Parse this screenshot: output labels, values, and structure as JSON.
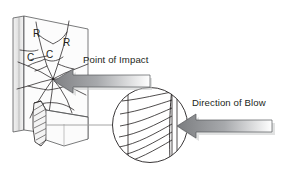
{
  "figure": {
    "title_text": "",
    "background_color": "#ffffff",
    "ink_color": "#231f20",
    "line_color": "#58595b",
    "arrow_fill_dark": "#808184",
    "arrow_fill_light": "#d1d3d4",
    "panel_fill": "#fbfbfb",
    "slab_fill": "#e8e8e8"
  },
  "labels": {
    "point_of_impact": "Point of Impact",
    "direction_of_blow": "Direction of Blow"
  },
  "crack_markers": [
    {
      "id": "radial-1",
      "text": "R",
      "x": 35,
      "y": 36
    },
    {
      "id": "radial-2",
      "text": "R",
      "x": 65,
      "y": 45
    },
    {
      "id": "concentric-1",
      "text": "C",
      "x": 30,
      "y": 60
    },
    {
      "id": "concentric-2",
      "text": "C",
      "x": 49,
      "y": 57
    }
  ],
  "legend_meaning": {
    "R": "Radial crack",
    "C": "Concentric crack"
  },
  "callout": {
    "name": "magnified-edge-view",
    "center_x": 150,
    "center_y": 125,
    "radius": 38,
    "description": "conchoidal-rib-marks"
  },
  "arrows": [
    {
      "id": "impact-arrow",
      "points_to": "point-of-impact",
      "direction": "left",
      "tip_x": 53,
      "tip_y": 79
    },
    {
      "id": "blow-arrow",
      "points_to": "fracture-edge",
      "direction": "left",
      "tip_x": 176,
      "tip_y": 124
    }
  ]
}
